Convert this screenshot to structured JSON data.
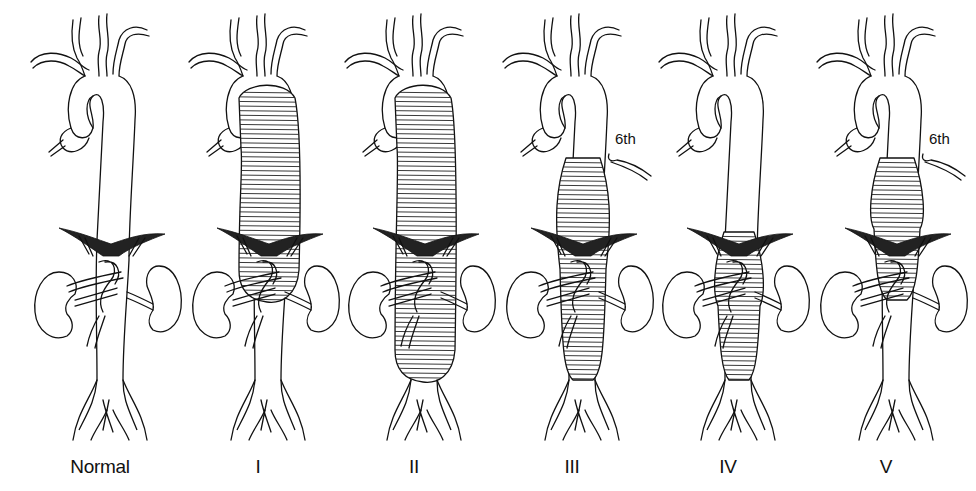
{
  "figure": {
    "panels": [
      {
        "id": "normal",
        "label": "Normal",
        "center_x": 100,
        "aneurysm": null,
        "rib_label": null
      },
      {
        "id": "type-1",
        "label": "I",
        "center_x": 258,
        "aneurysm": {
          "top": 88,
          "bottom": 300,
          "width": 56,
          "extends_into_arch": true
        },
        "rib_label": null
      },
      {
        "id": "type-2",
        "label": "II",
        "center_x": 414,
        "aneurysm": {
          "top": 88,
          "bottom": 380,
          "width": 56,
          "extends_into_arch": true
        },
        "rib_label": null
      },
      {
        "id": "type-3",
        "label": "III",
        "center_x": 572,
        "aneurysm": {
          "top": 158,
          "bottom": 380,
          "width": 46,
          "extends_into_arch": false
        },
        "rib_label": "6th"
      },
      {
        "id": "type-4",
        "label": "IV",
        "center_x": 728,
        "aneurysm": {
          "top": 232,
          "bottom": 380,
          "width": 42,
          "extends_into_arch": false
        },
        "rib_label": null
      },
      {
        "id": "type-5",
        "label": "V",
        "center_x": 886,
        "aneurysm": {
          "top": 158,
          "bottom": 300,
          "width": 46,
          "extends_into_arch": false
        },
        "rib_label": "6th"
      }
    ],
    "colors": {
      "ink": "#111111",
      "background": "#ffffff"
    }
  }
}
